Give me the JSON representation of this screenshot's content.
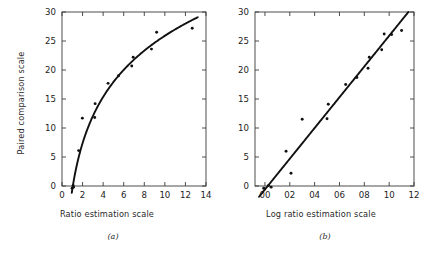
{
  "figure": {
    "caption_a": "(a)",
    "caption_b": "(b)",
    "y_axis_title": "Paired comparison scale"
  },
  "chart_data": [
    {
      "panel": "(a)",
      "type": "scatter",
      "title": "",
      "xlabel": "Ratio estimation scale",
      "ylabel": "Paired comparison scale",
      "xlim": [
        0,
        14
      ],
      "ylim": [
        0,
        30
      ],
      "xticks": [
        0,
        2,
        4,
        6,
        8,
        10,
        12,
        14
      ],
      "xtick_labels": [
        "0",
        "2",
        "4",
        "6",
        "8",
        "10",
        "12",
        "14"
      ],
      "yticks": [
        0,
        5,
        10,
        15,
        20,
        25,
        30
      ],
      "ytick_labels": [
        "0",
        "5",
        "10",
        "15",
        "20",
        "25",
        "30"
      ],
      "grid": false,
      "legend": "none",
      "points": [
        {
          "x": 0.98,
          "y": -0.4
        },
        {
          "x": 1.08,
          "y": 0.1
        },
        {
          "x": 1.12,
          "y": -0.2
        },
        {
          "x": 1.62,
          "y": 6.1
        },
        {
          "x": 1.98,
          "y": 11.7
        },
        {
          "x": 3.18,
          "y": 11.8
        },
        {
          "x": 3.22,
          "y": 14.2
        },
        {
          "x": 4.48,
          "y": 17.7
        },
        {
          "x": 5.5,
          "y": 19.0
        },
        {
          "x": 6.78,
          "y": 20.7
        },
        {
          "x": 6.92,
          "y": 22.2
        },
        {
          "x": 8.7,
          "y": 23.6
        },
        {
          "x": 9.2,
          "y": 26.5
        },
        {
          "x": 12.66,
          "y": 27.2
        }
      ],
      "fit": {
        "kind": "logarithmic",
        "description": "y = a + b*log10(x) through the scatter",
        "a": -0.6,
        "b": 26.5,
        "x_start": 0.95,
        "x_end": 13.2
      }
    },
    {
      "panel": "(b)",
      "type": "scatter",
      "title": "",
      "xlabel": "Log ratio estimation scale",
      "ylabel": "Paired comparison scale",
      "xlim": [
        -0.08,
        1.2
      ],
      "ylim": [
        0,
        30
      ],
      "xticks": [
        0.0,
        0.2,
        0.4,
        0.6,
        0.8,
        1.0,
        1.2
      ],
      "xtick_labels": [
        "00",
        "02",
        "04",
        "06",
        "08",
        "10",
        "12"
      ],
      "yticks": [
        0,
        5,
        10,
        15,
        20,
        25,
        30
      ],
      "ytick_labels": [
        "0",
        "5",
        "10",
        "15",
        "20",
        "25",
        "30"
      ],
      "grid": false,
      "legend": "none",
      "points": [
        {
          "x": -0.01,
          "y": -0.4
        },
        {
          "x": 0.03,
          "y": 0.1
        },
        {
          "x": 0.05,
          "y": -0.2
        },
        {
          "x": 0.21,
          "y": 2.2
        },
        {
          "x": 0.3,
          "y": 11.5
        },
        {
          "x": 0.17,
          "y": 6.0
        },
        {
          "x": 0.5,
          "y": 11.6
        },
        {
          "x": 0.51,
          "y": 14.1
        },
        {
          "x": 0.65,
          "y": 17.5
        },
        {
          "x": 0.74,
          "y": 18.7
        },
        {
          "x": 0.83,
          "y": 20.3
        },
        {
          "x": 0.84,
          "y": 22.2
        },
        {
          "x": 0.94,
          "y": 23.5
        },
        {
          "x": 0.96,
          "y": 26.2
        },
        {
          "x": 1.02,
          "y": 26.1
        },
        {
          "x": 1.1,
          "y": 26.8
        }
      ],
      "fit": {
        "kind": "linear",
        "description": "straight line fitted to log-transformed data",
        "intercept": -0.6,
        "slope": 26.5,
        "x_start": -0.055,
        "x_end": 1.155
      }
    }
  ]
}
